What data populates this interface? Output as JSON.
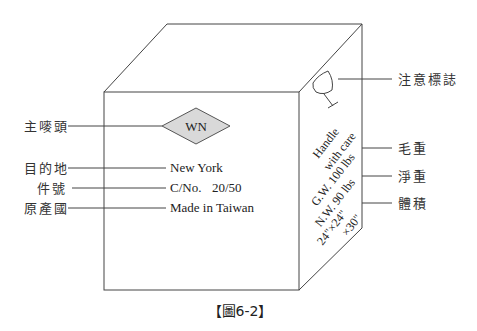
{
  "figure": {
    "caption": "【圖6-2】",
    "front_face": {
      "shipping_mark": "WN",
      "destination": "New York",
      "case_no_label": "C/No.",
      "case_no_value": "20/50",
      "origin": "Made in Taiwan"
    },
    "side_face": {
      "handle_line1": "Handle",
      "handle_line2": "with care",
      "gross_weight": "G.W. 100 lbs",
      "net_weight": "N.W. 90 lbs",
      "measurement_line1": "24\"×24\"",
      "measurement_line2": "×30\""
    },
    "left_labels": {
      "main_mark": "主嘜頭",
      "destination": "目的地",
      "case_number": "件號",
      "origin": "原產國"
    },
    "right_labels": {
      "caution_mark": "注意標誌",
      "gross_weight": "毛重",
      "net_weight": "淨重",
      "measurement": "體積"
    },
    "colors": {
      "diamond_fill": "#d9d9d9",
      "line": "#444444"
    }
  }
}
